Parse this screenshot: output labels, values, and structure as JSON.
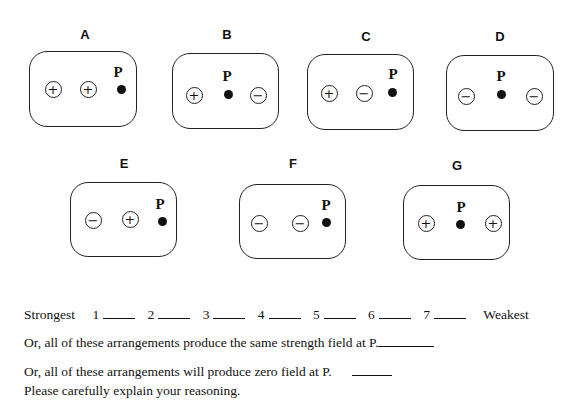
{
  "panels": [
    {
      "label": "A",
      "charges": [
        "+",
        "+"
      ],
      "point_label": "P"
    },
    {
      "label": "B",
      "charges": [
        "+",
        "−"
      ],
      "point_label": "P"
    },
    {
      "label": "C",
      "charges": [
        "+",
        "−"
      ],
      "point_label": "P"
    },
    {
      "label": "D",
      "charges": [
        "−",
        "−"
      ],
      "point_label": "P"
    },
    {
      "label": "E",
      "charges": [
        "−",
        "+"
      ],
      "point_label": "P"
    },
    {
      "label": "F",
      "charges": [
        "−",
        "−"
      ],
      "point_label": "P"
    },
    {
      "label": "G",
      "charges": [
        "+",
        "+"
      ],
      "point_label": "P"
    }
  ],
  "ranking": {
    "strongest_label": "Strongest",
    "weakest_label": "Weakest",
    "slots": [
      "1",
      "2",
      "3",
      "4",
      "5",
      "6",
      "7"
    ]
  },
  "options": {
    "same_strength": "Or, all of these arrangements produce the same strength field at P.",
    "zero_field": "Or, all of these arrangements will produce zero field at P.",
    "explain": "Please carefully explain your reasoning."
  }
}
